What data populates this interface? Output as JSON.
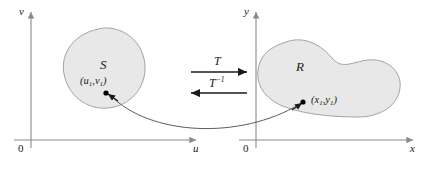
{
  "figure": {
    "caption_type": "coordinate-transformation-diagram",
    "background_color": "#ffffff",
    "region_fill": "#e8e8e8",
    "region_stroke": "#9a9a9a",
    "axis_color": "#8a8a8a",
    "arrow_color": "#1a1a1a",
    "text_color": "#1a1a1a"
  },
  "left_plane": {
    "vertical_axis_label": "v",
    "horizontal_axis_label": "u",
    "origin_label": "0",
    "region_label": "S",
    "point_label_u": "u",
    "point_label_v": "v",
    "point_sub": "1",
    "point_open": "(",
    "point_comma": ",",
    "point_close": ")"
  },
  "right_plane": {
    "vertical_axis_label": "y",
    "horizontal_axis_label": "x",
    "origin_label": "0",
    "region_label": "R",
    "point_label_x": "x",
    "point_label_y": "y",
    "point_sub": "1",
    "point_open": "(",
    "point_comma": ",",
    "point_close": ")"
  },
  "mapping": {
    "forward_label": "T",
    "inverse_label": "T",
    "inverse_exponent": "−1"
  }
}
